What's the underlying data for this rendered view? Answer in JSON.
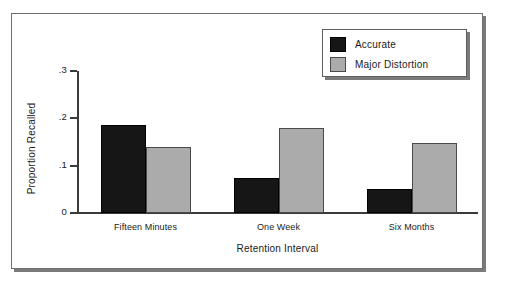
{
  "chart_data": {
    "type": "bar",
    "title": "",
    "xlabel": "Retention Interval",
    "ylabel": "Proportion Recalled",
    "categories": [
      "Fifteen Minutes",
      "One Week",
      "Six Months"
    ],
    "series": [
      {
        "name": "Accurate",
        "color": "#161616",
        "values": [
          0.185,
          0.075,
          0.05
        ]
      },
      {
        "name": "Major Distortion",
        "color": "#ababab",
        "values": [
          0.14,
          0.18,
          0.147
        ]
      }
    ],
    "ylim": [
      0,
      0.3
    ],
    "ytick_labels": [
      "0",
      ".1",
      ".2",
      ".3"
    ],
    "ytick_values": [
      0,
      0.1,
      0.2,
      0.3
    ],
    "grid": false,
    "legend_position": "top-right",
    "legend_entries": [
      "Accurate",
      "Major Distortion"
    ]
  },
  "figure": {
    "frame_border_color": "#6e6e6e",
    "shadow_color": "#7b7b7b",
    "background_color": "#ffffff",
    "axis_color": "#3a3a3a"
  }
}
